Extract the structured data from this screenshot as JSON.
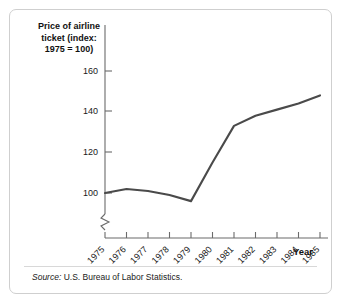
{
  "figure": {
    "title": "Price of airline\nticket (index:\n1975 = 100)",
    "source_label": "Source:",
    "source_text": " U.S. Bureau of Labor Statistics."
  },
  "chart_data": {
    "type": "line",
    "title": "Price of airline ticket (index: 1975 = 100)",
    "xlabel": "Year",
    "ylabel": "Price of airline ticket (index: 1975 = 100)",
    "categories": [
      "1975",
      "1976",
      "1977",
      "1978",
      "1979",
      "1980",
      "1981",
      "1982",
      "1983",
      "1984",
      "1985"
    ],
    "values": [
      100,
      102,
      101,
      99,
      96,
      115,
      133,
      138,
      141,
      144,
      148
    ],
    "ytick_labels": [
      "100",
      "120",
      "140",
      "160"
    ],
    "ytick_values": [
      100,
      120,
      140,
      160
    ],
    "ylim": [
      88,
      168
    ],
    "xlim": [
      "1975",
      "1985"
    ],
    "grid": false,
    "legend": null,
    "axis_break": true,
    "line_color": "#4a4a4a",
    "axis_color": "#6b6b6b"
  }
}
